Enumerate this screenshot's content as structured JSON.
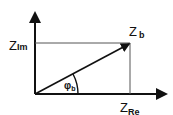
{
  "diagram": {
    "type": "phasor-impedance-diagram",
    "labels": {
      "imag_axis": {
        "main": "Z",
        "sub": "Im"
      },
      "real_axis": {
        "main": "Z",
        "sub": "Re"
      },
      "vector": {
        "main": "Z",
        "sub": "b"
      },
      "angle": {
        "main": "φ",
        "sub": "b"
      }
    },
    "colors": {
      "line": "#111111",
      "guide": "#555555",
      "background": "#ffffff"
    }
  }
}
